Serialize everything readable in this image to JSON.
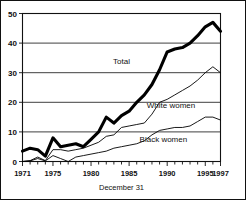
{
  "figure": {
    "axis_title": "December 31",
    "series_labels": {
      "total": "Total",
      "white_women": "White women",
      "black_women": "Black women"
    }
  },
  "chart_data": {
    "type": "line",
    "title": "",
    "xlabel": "December 31",
    "ylabel": "",
    "xlim": [
      1971,
      1997
    ],
    "ylim": [
      0,
      50
    ],
    "grid": true,
    "legend": "inline-annotations",
    "ytick_labels": [
      "0",
      "10",
      "20",
      "30",
      "40",
      "50"
    ],
    "yticks": [
      0,
      10,
      20,
      30,
      40,
      50
    ],
    "xtick_labels": [
      "1971",
      "1975",
      "1980",
      "1985",
      "1990",
      "1995",
      "1997"
    ],
    "xticks": [
      1971,
      1975,
      1980,
      1985,
      1990,
      1995,
      1997
    ],
    "x": [
      1971,
      1972,
      1973,
      1974,
      1975,
      1976,
      1977,
      1978,
      1979,
      1980,
      1981,
      1982,
      1983,
      1984,
      1985,
      1986,
      1987,
      1988,
      1989,
      1990,
      1991,
      1992,
      1993,
      1994,
      1995,
      1996,
      1997
    ],
    "series": [
      {
        "name": "Total",
        "values": [
          3.5,
          4.5,
          4.0,
          1.8,
          8.0,
          5.0,
          5.5,
          6.0,
          5.0,
          7.5,
          10.0,
          15.0,
          13.0,
          15.5,
          17.0,
          20.0,
          22.5,
          26.0,
          31.0,
          37.0,
          38.0,
          38.5,
          40.0,
          42.5,
          45.5,
          47.0,
          44.0
        ]
      },
      {
        "name": "White women",
        "values": [
          0.0,
          0.3,
          1.5,
          0.3,
          4.0,
          4.0,
          3.5,
          4.0,
          4.5,
          5.5,
          6.5,
          8.5,
          9.0,
          11.5,
          12.0,
          12.5,
          13.0,
          16.0,
          20.0,
          21.0,
          22.5,
          24.0,
          25.5,
          27.5,
          30.0,
          32.0,
          30.0
        ]
      },
      {
        "name": "Black women",
        "values": [
          0.0,
          0.2,
          1.0,
          0.2,
          2.0,
          1.0,
          0.0,
          1.5,
          2.0,
          2.5,
          3.0,
          3.5,
          4.5,
          5.0,
          5.5,
          6.0,
          7.0,
          9.0,
          10.5,
          11.0,
          11.5,
          11.5,
          12.0,
          13.5,
          15.0,
          15.0,
          14.0
        ]
      }
    ],
    "annotations": [
      {
        "text": "Total",
        "x": 1984.0,
        "y": 33.0
      },
      {
        "text": "White women",
        "x": 1990.5,
        "y": 18.0
      },
      {
        "text": "Black women",
        "x": 1989.5,
        "y": 6.5
      }
    ]
  }
}
